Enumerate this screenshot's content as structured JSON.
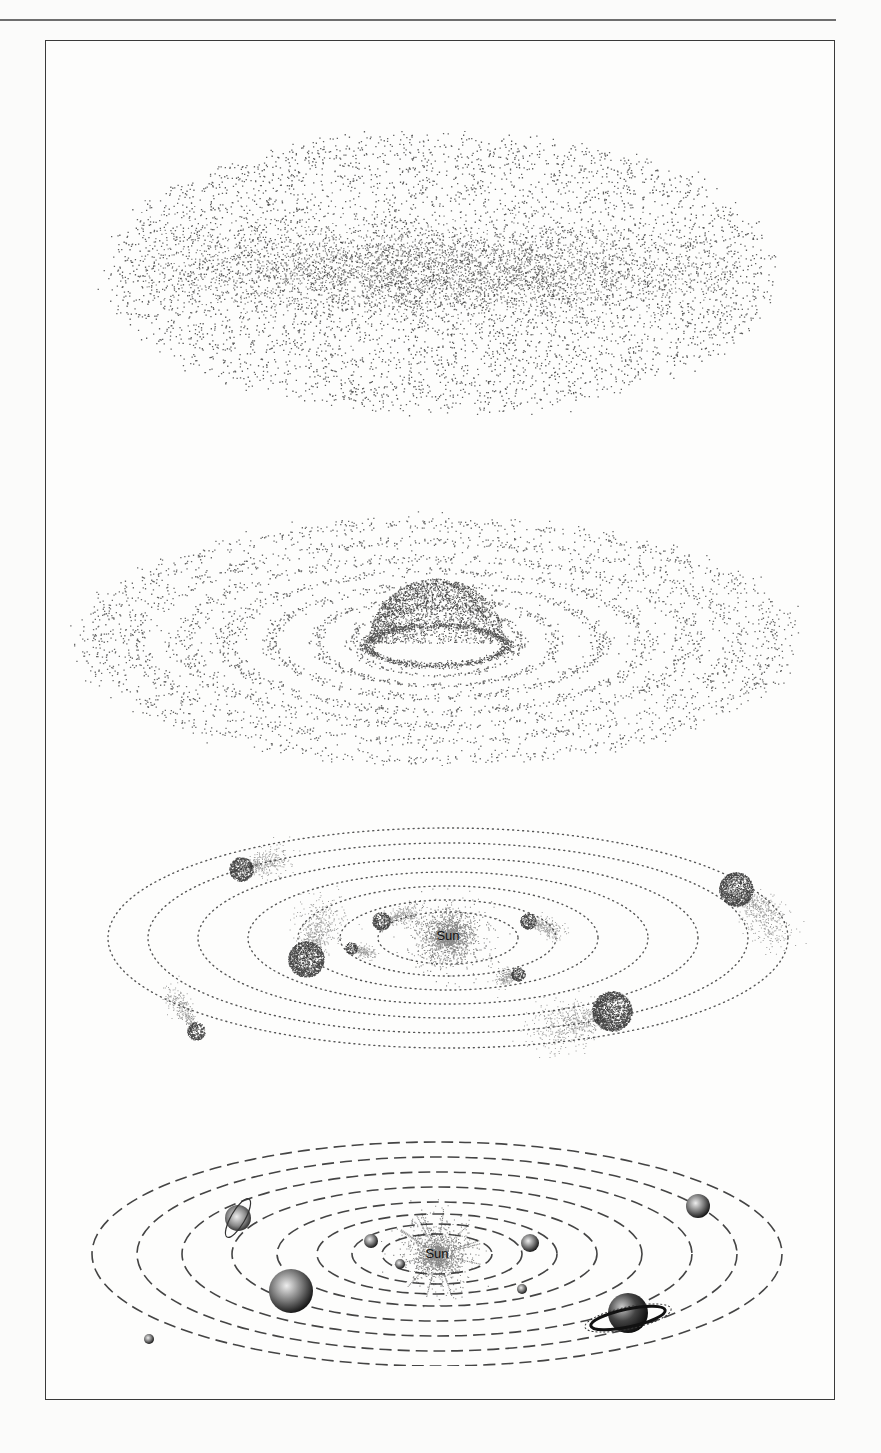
{
  "figure": {
    "border_color": "#3a3a3a",
    "ink_color": "#2a2a2a",
    "panels": [
      {
        "id": "stage-1",
        "name": "diffuse-nebula",
        "label": ""
      },
      {
        "id": "stage-2",
        "name": "flattened-rotating-disk",
        "label": ""
      },
      {
        "id": "stage-3",
        "name": "protoplanets-forming",
        "label": "Sun"
      },
      {
        "id": "stage-4",
        "name": "formed-solar-system",
        "label": "Sun"
      }
    ]
  }
}
